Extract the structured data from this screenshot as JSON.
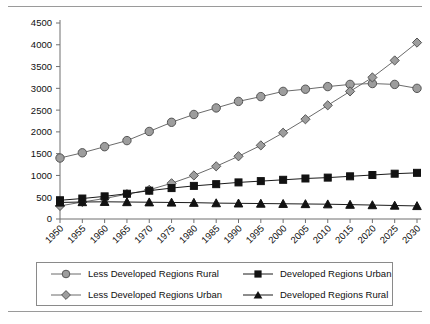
{
  "figure": {
    "has_top_rule": true,
    "has_bottom_rule": true,
    "background": "#ffffff"
  },
  "legend": {
    "position": "below-plot",
    "entries": [
      {
        "label": "Less Developed Regions Rural",
        "marker": "circle-icon",
        "color": "#9d9d9d",
        "line_color": "#6b6b6b"
      },
      {
        "label": "Developed Regions Urban",
        "marker": "square-icon",
        "color": "#121212",
        "line_color": "#1b1b1b"
      },
      {
        "label": "Less Developed Regions Urban",
        "marker": "diamond-icon",
        "color": "#9d9d9d",
        "line_color": "#6b6b6b"
      },
      {
        "label": "Developed Regions Rural",
        "marker": "triangle-icon",
        "color": "#121212",
        "line_color": "#1b1b1b"
      }
    ]
  },
  "chart_data": {
    "type": "line",
    "title": "",
    "subtitle": "",
    "xlabel": "",
    "ylabel": "",
    "grid": false,
    "legend_position": "bottom",
    "x": [
      1950,
      1955,
      1960,
      1965,
      1970,
      1975,
      1980,
      1985,
      1990,
      1995,
      2000,
      2005,
      2010,
      2015,
      2020,
      2025,
      2030
    ],
    "categories": [
      "1950",
      "1955",
      "1960",
      "1965",
      "1970",
      "1975",
      "1980",
      "1985",
      "1990",
      "1995",
      "2000",
      "2005",
      "2010",
      "2015",
      "2020",
      "2025",
      "2030"
    ],
    "xlim": [
      1950,
      2030
    ],
    "ylim": [
      0,
      4500
    ],
    "yticks": [
      0,
      500,
      1000,
      1500,
      2000,
      2500,
      3000,
      3500,
      4000,
      4500
    ],
    "ytick_labels": [
      "0",
      "500",
      "1000",
      "1500",
      "2000",
      "2500",
      "3000",
      "3500",
      "4000",
      "4500"
    ],
    "series": [
      {
        "name": "Less Developed Regions Rural",
        "marker": "circle",
        "color": "#9d9d9d",
        "line_color": "#6b6b6b",
        "values": [
          1400,
          1520,
          1660,
          1800,
          2010,
          2220,
          2400,
          2550,
          2700,
          2810,
          2930,
          2980,
          3040,
          3090,
          3110,
          3090,
          3000
        ]
      },
      {
        "name": "Less Developed Regions Urban",
        "marker": "diamond",
        "color": "#9d9d9d",
        "line_color": "#6b6b6b",
        "values": [
          300,
          390,
          470,
          570,
          670,
          820,
          1000,
          1210,
          1440,
          1690,
          1980,
          2290,
          2610,
          2930,
          3250,
          3640,
          4050
        ]
      },
      {
        "name": "Developed Regions Urban",
        "marker": "square",
        "color": "#121212",
        "line_color": "#1b1b1b",
        "values": [
          430,
          470,
          520,
          580,
          650,
          710,
          760,
          800,
          840,
          870,
          900,
          930,
          950,
          980,
          1010,
          1040,
          1060
        ]
      },
      {
        "name": "Developed Regions Rural",
        "marker": "triangle",
        "color": "#121212",
        "line_color": "#1b1b1b",
        "values": [
          380,
          390,
          395,
          390,
          385,
          380,
          375,
          365,
          360,
          355,
          350,
          345,
          340,
          330,
          320,
          310,
          300
        ]
      }
    ]
  }
}
